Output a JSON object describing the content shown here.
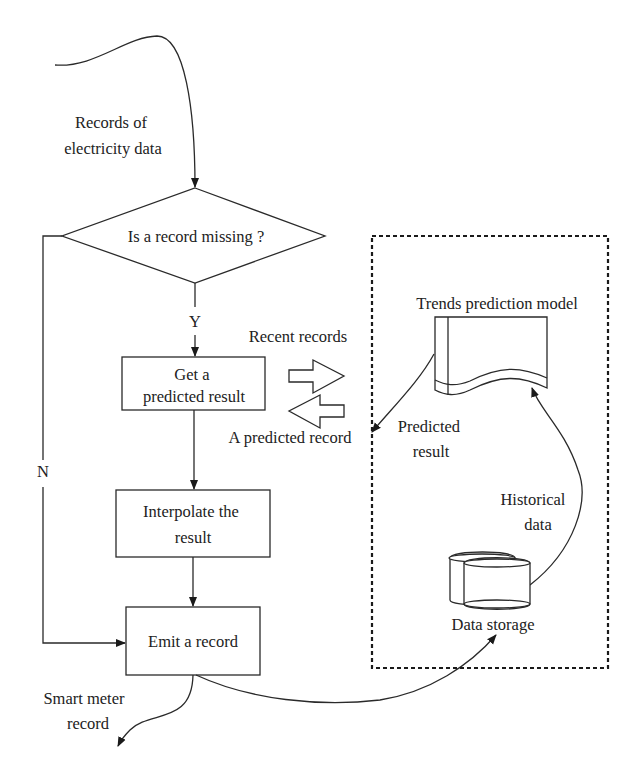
{
  "diagram": {
    "colors": {
      "stroke": "#2a2a2a",
      "text": "#222222",
      "background": "#ffffff"
    },
    "input_label": [
      "Records of",
      "electricity data"
    ],
    "decision": {
      "label": "Is a record missing ?",
      "yes_label": "Y",
      "no_label": "N"
    },
    "process_get": [
      "Get a",
      "predicted result"
    ],
    "process_interpolate": [
      "Interpolate the",
      "result"
    ],
    "process_emit": "Emit a record",
    "output_label": [
      "Smart meter",
      "record"
    ],
    "exchange": {
      "recent_records": "Recent records",
      "predicted_record": "A predicted record"
    },
    "subsystem": {
      "model_label": "Trends prediction model",
      "predicted_result": [
        "Predicted",
        "result"
      ],
      "historical_data": [
        "Historical",
        "data"
      ],
      "storage_label": "Data storage"
    }
  }
}
